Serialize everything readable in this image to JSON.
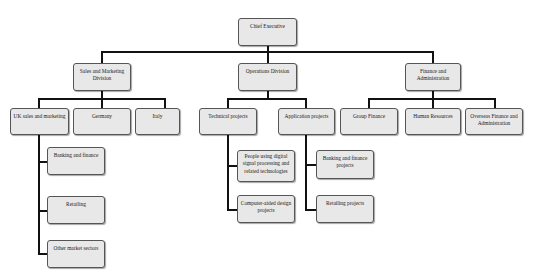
{
  "chart": {
    "root": {
      "label": "Chief Executive"
    },
    "divisions": [
      {
        "label": "Sales and Marketing Division",
        "departments": [
          {
            "label": "UK sales and marketing",
            "units": [
              {
                "label": "Banking and finance"
              },
              {
                "label": "Retailing"
              },
              {
                "label": "Other market sectors"
              }
            ]
          },
          {
            "label": "Germany"
          },
          {
            "label": "Italy"
          }
        ]
      },
      {
        "label": "Operations Division",
        "departments": [
          {
            "label": "Technical projects",
            "units": [
              {
                "label": "People using digital signal processing and related technologies"
              },
              {
                "label": "Computer-aided design projects"
              }
            ]
          },
          {
            "label": "Application projects",
            "units": [
              {
                "label": "Banking and finance projects"
              },
              {
                "label": "Retailing projects"
              }
            ]
          }
        ]
      },
      {
        "label": "Finance and Administration",
        "departments": [
          {
            "label": "Group Finance"
          },
          {
            "label": "Human Resources"
          },
          {
            "label": "Overseas Finance and Administration"
          }
        ]
      }
    ]
  }
}
